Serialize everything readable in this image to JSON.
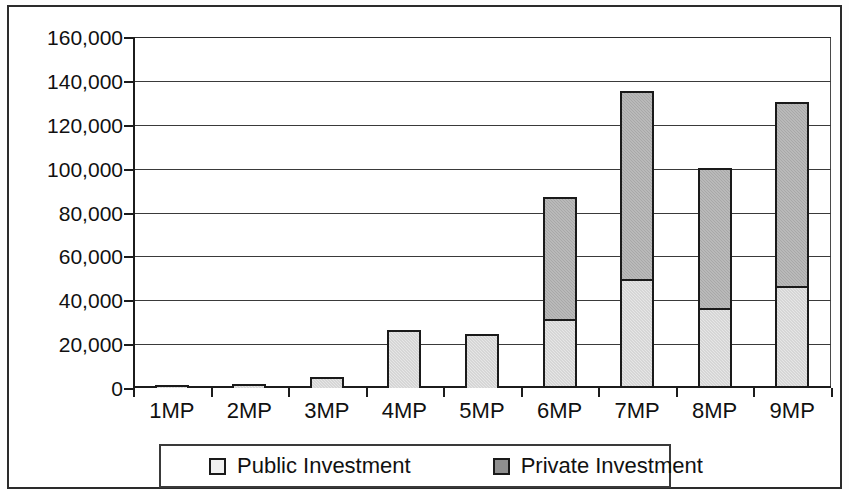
{
  "chart_data": {
    "type": "bar",
    "subtype": "stacked-column",
    "title": "",
    "xlabel": "",
    "ylabel": "",
    "categories": [
      "1MP",
      "2MP",
      "3MP",
      "4MP",
      "5MP",
      "6MP",
      "7MP",
      "8MP",
      "9MP"
    ],
    "series": [
      {
        "name": "Public Investment",
        "color": "#e6e6e6",
        "values": [
          1500,
          1800,
          5000,
          26500,
          24600,
          31500,
          49500,
          36500,
          46500
        ]
      },
      {
        "name": "Private Investment",
        "color": "#a8a8a8",
        "values": [
          0,
          0,
          0,
          0,
          0,
          55500,
          86000,
          64000,
          84000
        ]
      }
    ],
    "totals": [
      1500,
      1800,
      5000,
      26500,
      24600,
      87000,
      135500,
      100500,
      130500
    ],
    "ylim": [
      0,
      160000
    ],
    "ytick_step": 20000,
    "ytick_labels": [
      "0",
      "20,000",
      "40,000",
      "60,000",
      "80,000",
      "100,000",
      "120,000",
      "140,000",
      "160,000"
    ],
    "ytick_values": [
      0,
      20000,
      40000,
      60000,
      80000,
      100000,
      120000,
      140000,
      160000
    ],
    "grid": true,
    "legend_position": "bottom"
  },
  "legend": {
    "items": [
      {
        "label": "Public Investment",
        "swatch": "public-swatch-icon"
      },
      {
        "label": "Private Investment",
        "swatch": "private-swatch-icon"
      }
    ]
  }
}
